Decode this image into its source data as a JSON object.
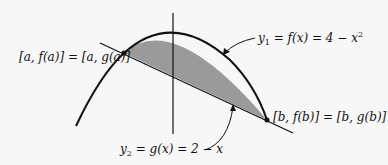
{
  "figure": {
    "labels": {
      "point_a": "[a, f(a)] = [a, g(a)]",
      "point_b": "[b, f(b)] = [b, g(b)]",
      "curve_y1_lhs": "y",
      "curve_y1_sub": "1",
      "curve_y1_rhs": " = f(x) = 4 − x",
      "curve_y1_sup": "2",
      "line_y2_lhs": "y",
      "line_y2_sub": "2",
      "line_y2_rhs": " = g(x) = 2 − x"
    },
    "colors": {
      "stroke": "#111111",
      "shade": "#9a9a9a",
      "background": "#f7f7f7"
    }
  }
}
